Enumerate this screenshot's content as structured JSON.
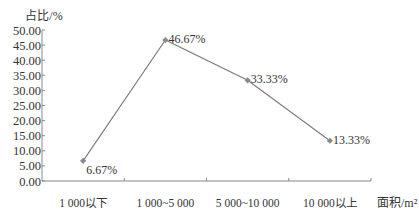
{
  "chart_data": {
    "type": "line",
    "title": "",
    "ylabel": "占比/%",
    "xlabel": "面积/m²",
    "ylim": [
      0,
      50
    ],
    "yticks": [
      "0.00",
      "5.00",
      "10.00",
      "15.00",
      "20.00",
      "25.00",
      "30.00",
      "35.00",
      "40.00",
      "45.00",
      "50.00"
    ],
    "categories": [
      "1 000以下",
      "1 000~5 000",
      "5 000~10 000",
      "10 000以上"
    ],
    "values": [
      6.67,
      46.67,
      33.33,
      13.33
    ],
    "data_labels": [
      "6.67%",
      "46.67%",
      "33.33%",
      "13.33%"
    ],
    "grid": false,
    "legend": null,
    "colors": {
      "line": "#7a7a7a",
      "marker": "#8a8a8a",
      "axis": "#888888"
    }
  }
}
